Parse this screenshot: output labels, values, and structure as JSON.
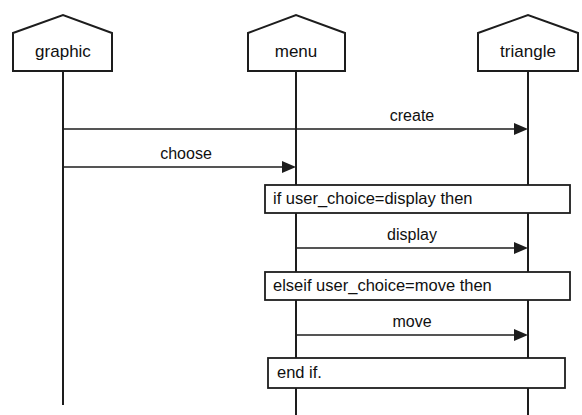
{
  "diagram": {
    "type": "uml-sequence-diagram",
    "canvas": {
      "width": 582,
      "height": 415
    },
    "colors": {
      "background": "#ffffff",
      "stroke": "#1d1d1d",
      "text": "#101010"
    }
  },
  "lifelines": [
    {
      "id": "graphic",
      "label": "graphic",
      "center_x": 63,
      "box": {
        "x": 13,
        "y": 15,
        "width": 99,
        "height": 56
      },
      "apex_y": 15,
      "shoulder_y": 33,
      "bottom_y": 71,
      "line_end_y": 405
    },
    {
      "id": "menu",
      "label": "menu",
      "center_x": 296,
      "box": {
        "x": 248,
        "y": 15,
        "width": 97,
        "height": 56
      },
      "apex_y": 15,
      "shoulder_y": 33,
      "bottom_y": 71,
      "line_end_y": 415
    },
    {
      "id": "triangle",
      "label": "triangle",
      "center_x": 528,
      "box": {
        "x": 478,
        "y": 15,
        "width": 100,
        "height": 56
      },
      "apex_y": 15,
      "shoulder_y": 33,
      "bottom_y": 71,
      "line_end_y": 415
    }
  ],
  "messages": [
    {
      "id": "create",
      "label": "create",
      "from_x": 63,
      "to_x": 528,
      "y": 129,
      "label_x": 412,
      "label_y": 121
    },
    {
      "id": "choose",
      "label": "choose",
      "from_x": 63,
      "to_x": 296,
      "y": 167,
      "label_x": 186,
      "label_y": 159
    },
    {
      "id": "display",
      "label": "display",
      "from_x": 296,
      "to_x": 528,
      "y": 248,
      "label_x": 412,
      "label_y": 240
    },
    {
      "id": "move",
      "label": "move",
      "from_x": 296,
      "to_x": 528,
      "y": 335,
      "label_x": 412,
      "label_y": 327
    }
  ],
  "fragments": [
    {
      "id": "if-branch",
      "label": "if user_choice=display then",
      "x": 265,
      "y": 185,
      "width": 305,
      "height": 28,
      "text_x": 273,
      "text_y": 199
    },
    {
      "id": "elseif-branch",
      "label": "elseif user_choice=move then",
      "x": 265,
      "y": 272,
      "width": 305,
      "height": 28,
      "text_x": 273,
      "text_y": 286
    },
    {
      "id": "end-if",
      "label": "end if.",
      "x": 268,
      "y": 358,
      "width": 297,
      "height": 30,
      "text_x": 277,
      "text_y": 373
    }
  ]
}
